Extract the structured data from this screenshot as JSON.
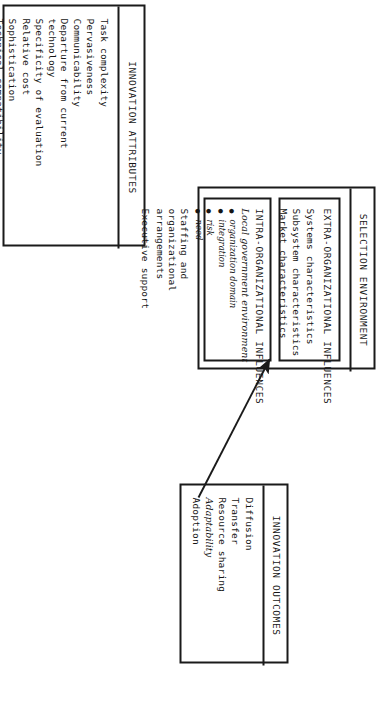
{
  "figure": {
    "orientation": "rotated-90-clockwise",
    "background": "#ffffff",
    "ink_color": "#151515"
  },
  "innovation_attributes": {
    "title": "INNOVATION ATTRIBUTES",
    "items": [
      "Task complexity",
      "Pervasiveness",
      "Communicability",
      "Departure from current technology",
      "Specificity of evaluation",
      "Relative cost",
      "Sophistication",
      "Technical compatibility"
    ]
  },
  "selection_environment": {
    "title": "SELECTION ENVIRONMENT",
    "extra_organizational": {
      "title": "EXTRA-ORGANIZATIONAL INFLUENCES",
      "items": [
        "Systems characteristics",
        "Subsystem characteristics",
        "Market characteristics"
      ]
    },
    "intra_organizational": {
      "title": "INTRA-ORGANIZATIONAL INFLUENCES",
      "handwritten_heading": "Local government environment",
      "handwritten_bullets": [
        "organization domain",
        "integration",
        "risk",
        "need"
      ],
      "items": [
        "Staffing and organizational arrangements",
        "Executive support"
      ]
    }
  },
  "innovation_outcomes": {
    "title": "INNOVATION OUTCOMES",
    "items": [
      {
        "label": "Diffusion",
        "style": "printed"
      },
      {
        "label": "Transfer",
        "style": "printed"
      },
      {
        "label": "Resource sharing",
        "style": "printed"
      },
      {
        "label": "Adaptability",
        "style": "handwritten"
      },
      {
        "label": "Adoption",
        "style": "printed"
      }
    ]
  },
  "annotation_arrow": {
    "name": "handwritten-arrow",
    "from": "intra-organizational-influences",
    "to": "adaptability"
  }
}
